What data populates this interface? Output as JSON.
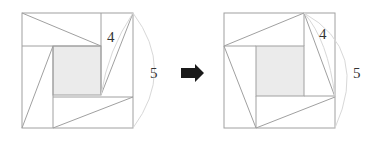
{
  "figure": {
    "left": {
      "label_short_leg": "4",
      "label_hypotenuse": "5"
    },
    "arrow": "right-arrow",
    "right": {
      "label_short_leg": "4",
      "label_hypotenuse": "5"
    }
  },
  "colors": {
    "lines": "#a0a0a0",
    "shade": "#ebebeb",
    "arc": "#d8d8d8",
    "arrow": "#1a1a1a",
    "text": "#333333"
  }
}
